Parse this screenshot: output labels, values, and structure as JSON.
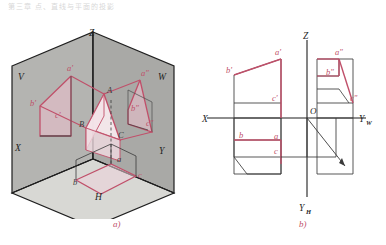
{
  "page": {
    "header_text": "第三章 点、直线与平面的投影",
    "caption_a": "a)",
    "caption_b": "b)"
  },
  "figure_a": {
    "name": "three-plane-pictorial",
    "planes": [
      {
        "id": "V",
        "label": "V",
        "x": 18,
        "y": 62
      },
      {
        "id": "W",
        "label": "W",
        "x": 163,
        "y": 62
      },
      {
        "id": "H",
        "label": "H",
        "x": 98,
        "y": 197
      },
      {
        "id": "X",
        "label": "X",
        "x": 19,
        "y": 147
      },
      {
        "id": "Y",
        "label": "Y",
        "x": 163,
        "y": 150
      },
      {
        "id": "Z",
        "label": "Z",
        "x": 93,
        "y": 31
      }
    ],
    "space_points": [
      {
        "id": "A",
        "label": "A",
        "x": 105,
        "y": 88
      },
      {
        "id": "B",
        "label": "B",
        "x": 82,
        "y": 109
      },
      {
        "id": "C",
        "label": "C",
        "x": 115,
        "y": 117
      }
    ],
    "v_projection": [
      {
        "id": "a-prime",
        "label": "a'",
        "x": 66,
        "y": 53
      },
      {
        "id": "b-prime",
        "label": "b'",
        "x": 33,
        "y": 89
      },
      {
        "id": "c-prime",
        "label": "c'",
        "x": 64,
        "y": 101
      }
    ],
    "w_projection": [
      {
        "id": "a-dprime",
        "label": "a\"",
        "x": 139,
        "y": 56
      },
      {
        "id": "b-dprime",
        "label": "b\"",
        "x": 129,
        "y": 92
      },
      {
        "id": "c-dprime",
        "label": "c\"",
        "x": 144,
        "y": 106
      }
    ],
    "h_projection": [
      {
        "id": "a-h",
        "label": "a",
        "x": 119,
        "y": 152
      },
      {
        "id": "b-h",
        "label": "b",
        "x": 82,
        "y": 170
      },
      {
        "id": "c-h",
        "label": "c",
        "x": 129,
        "y": 166
      }
    ]
  },
  "figure_b": {
    "name": "orthographic-projection",
    "axes": [
      {
        "id": "X",
        "label": "X",
        "x": 202,
        "y": 118
      },
      {
        "id": "Yw",
        "label": "Y",
        "sub": "W",
        "x": 359,
        "y": 118
      },
      {
        "id": "Z",
        "label": "Z",
        "x": 299,
        "y": 39
      },
      {
        "id": "Yh",
        "label": "Y",
        "sub": "H",
        "x": 295,
        "y": 197
      },
      {
        "id": "O",
        "label": "O",
        "x": 307,
        "y": 113
      }
    ],
    "front_view_points": [
      {
        "id": "a-prime",
        "label": "a'",
        "x": 273,
        "y": 55
      },
      {
        "id": "b-prime",
        "label": "b'",
        "x": 228,
        "y": 72
      },
      {
        "id": "c-prime",
        "label": "c'",
        "x": 274,
        "y": 100
      }
    ],
    "side_view_points": [
      {
        "id": "a-dprime",
        "label": "a\"",
        "x": 332,
        "y": 55
      },
      {
        "id": "b-dprime",
        "label": "b\"",
        "x": 326,
        "y": 75
      },
      {
        "id": "c-dprime",
        "label": "c\"",
        "x": 348,
        "y": 100
      }
    ],
    "top_view_points": [
      {
        "id": "b",
        "label": "b",
        "x": 245,
        "y": 140
      },
      {
        "id": "a",
        "label": "a",
        "x": 279,
        "y": 141
      },
      {
        "id": "c",
        "label": "c",
        "x": 279,
        "y": 152
      }
    ]
  },
  "colors": {
    "accent_red": "#c0506a",
    "line_black": "#2b2b2b",
    "plane_gray_v": "#b3b3b0",
    "plane_gray_w": "#a8a8a5",
    "plane_gray_h": "#d6d6d2",
    "tri_fill": "#f7e8ec",
    "proj_fill": "#eccdd5",
    "paper": "#ffffff"
  }
}
